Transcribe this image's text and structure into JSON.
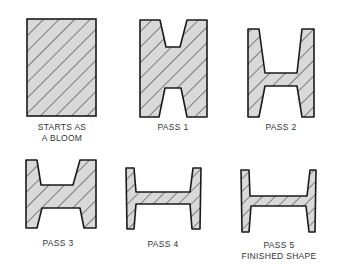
{
  "diagram": {
    "colors": {
      "fill": "#d9d9d9",
      "stroke": "#1a1a1a",
      "hatch": "#2a2a2a"
    },
    "stages": [
      {
        "id": "bloom",
        "label_line1": "STARTS AS",
        "label_line2": "A BLOOM"
      },
      {
        "id": "pass1",
        "label_line1": "PASS 1",
        "label_line2": ""
      },
      {
        "id": "pass2",
        "label_line1": "PASS 2",
        "label_line2": ""
      },
      {
        "id": "pass3",
        "label_line1": "PASS 3",
        "label_line2": ""
      },
      {
        "id": "pass4",
        "label_line1": "PASS 4",
        "label_line2": ""
      },
      {
        "id": "pass5",
        "label_line1": "PASS 5",
        "label_line2": "FINISHED SHAPE"
      }
    ]
  }
}
